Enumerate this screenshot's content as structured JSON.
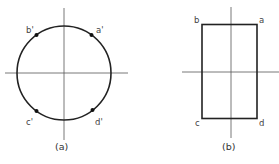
{
  "figure_a": {
    "caption": "(a)",
    "shape": "circle",
    "points": [
      {
        "label": "a'",
        "quadrant": "upper-right",
        "angle_deg": 45
      },
      {
        "label": "b'",
        "quadrant": "upper-left",
        "angle_deg": 135
      },
      {
        "label": "c'",
        "quadrant": "lower-left",
        "angle_deg": 225
      },
      {
        "label": "d'",
        "quadrant": "lower-right",
        "angle_deg": 315
      }
    ]
  },
  "figure_b": {
    "caption": "(b)",
    "shape": "rectangle",
    "corners": [
      {
        "label": "a",
        "position": "top-right"
      },
      {
        "label": "b",
        "position": "top-left"
      },
      {
        "label": "c",
        "position": "bottom-left"
      },
      {
        "label": "d",
        "position": "bottom-right"
      }
    ]
  }
}
